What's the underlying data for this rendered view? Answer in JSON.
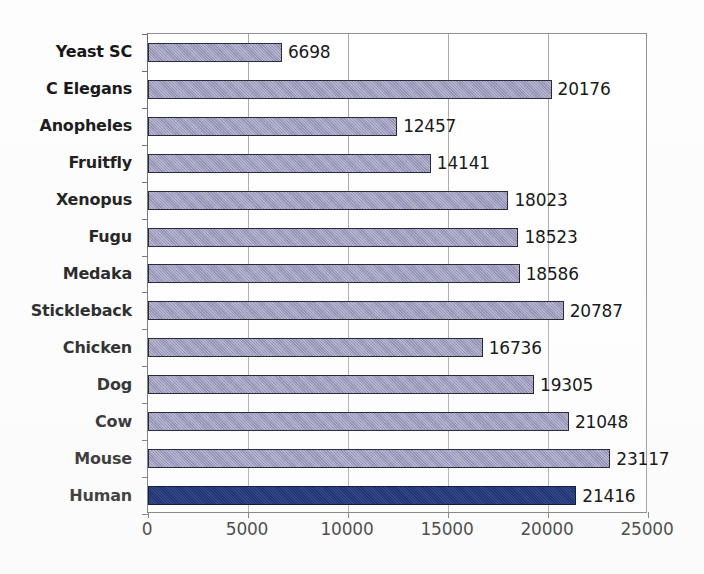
{
  "chart_data": {
    "type": "bar",
    "orientation": "horizontal",
    "title": "",
    "xlabel": "",
    "ylabel": "",
    "xlim": [
      0,
      25000
    ],
    "xticks": [
      0,
      5000,
      10000,
      15000,
      20000,
      25000
    ],
    "xtick_labels": [
      "0",
      "5000",
      "10000",
      "15000",
      "20000",
      "25000"
    ],
    "grid": "vertical",
    "legend": "none",
    "bar_color": "#9a99bd",
    "highlight_color": "#1f3375",
    "highlight_category": "Human",
    "categories": [
      "Yeast SC",
      "C Elegans",
      "Anopheles",
      "Fruitfly",
      "Xenopus",
      "Fugu",
      "Medaka",
      "Stickleback",
      "Chicken",
      "Dog",
      "Cow",
      "Mouse",
      "Human"
    ],
    "values": [
      6698,
      20176,
      12457,
      14141,
      18023,
      18523,
      18586,
      20787,
      16736,
      19305,
      21048,
      23117,
      21416
    ],
    "value_labels": [
      "6698",
      "20176",
      "12457",
      "14141",
      "18023",
      "18523",
      "18586",
      "20787",
      "16736",
      "19305",
      "21048",
      "23117",
      "21416"
    ]
  }
}
